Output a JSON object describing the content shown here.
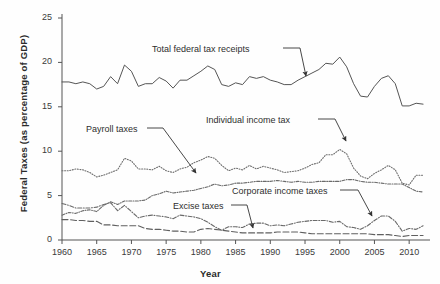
{
  "chart_data": {
    "type": "line",
    "title": "",
    "xlabel": "Year",
    "ylabel": "Federal Taxes (as percentage of GDP)",
    "xlim": [
      1960,
      2013
    ],
    "ylim": [
      0,
      25
    ],
    "ytick_values": [
      0,
      5,
      10,
      15,
      20,
      25
    ],
    "ytick_labels": [
      "0",
      "5",
      "10",
      "15",
      "20",
      "25"
    ],
    "xtick_values": [
      1960,
      1965,
      1970,
      1975,
      1980,
      1985,
      1990,
      1995,
      2000,
      2005,
      2010
    ],
    "xtick_labels": [
      "1960",
      "1965",
      "1970",
      "1975",
      "1980",
      "1985",
      "1990",
      "1995",
      "2000",
      "2005",
      "2010"
    ],
    "grid": false,
    "legend_position": "inline-annotations",
    "x": [
      1960,
      1961,
      1962,
      1963,
      1964,
      1965,
      1966,
      1967,
      1968,
      1969,
      1970,
      1971,
      1972,
      1973,
      1974,
      1975,
      1976,
      1977,
      1978,
      1979,
      1980,
      1981,
      1982,
      1983,
      1984,
      1985,
      1986,
      1987,
      1988,
      1989,
      1990,
      1991,
      1992,
      1993,
      1994,
      1995,
      1996,
      1997,
      1998,
      1999,
      2000,
      2001,
      2002,
      2003,
      2004,
      2005,
      2006,
      2007,
      2008,
      2009,
      2010,
      2011,
      2012
    ],
    "series": [
      {
        "name": "Total federal tax receipts",
        "style": "solid",
        "color": "#555555",
        "values": [
          17.8,
          17.8,
          17.6,
          17.8,
          17.6,
          17.0,
          17.3,
          18.4,
          17.6,
          19.7,
          19.0,
          17.3,
          17.6,
          17.6,
          18.3,
          17.9,
          17.1,
          18.0,
          18.0,
          18.5,
          19.0,
          19.6,
          19.2,
          17.5,
          17.3,
          17.7,
          17.5,
          18.4,
          18.2,
          18.4,
          18.0,
          17.8,
          17.5,
          17.5,
          18.0,
          18.4,
          18.8,
          19.2,
          19.9,
          19.8,
          20.6,
          19.5,
          17.6,
          16.2,
          16.1,
          17.3,
          18.2,
          18.5,
          17.6,
          15.1,
          15.1,
          15.4,
          15.3
        ]
      },
      {
        "name": "Individual income tax",
        "style": "dotted",
        "color": "#6e6e6e",
        "values": [
          7.8,
          7.8,
          8.0,
          7.9,
          7.6,
          7.1,
          7.3,
          7.6,
          7.9,
          9.2,
          8.9,
          8.0,
          8.0,
          7.9,
          8.3,
          7.8,
          7.6,
          8.0,
          8.2,
          8.7,
          9.0,
          9.4,
          9.2,
          8.4,
          7.8,
          8.1,
          7.9,
          8.4,
          8.0,
          8.3,
          8.1,
          7.9,
          7.6,
          7.7,
          7.8,
          8.1,
          8.5,
          8.7,
          9.6,
          9.6,
          10.2,
          9.7,
          8.1,
          7.2,
          6.9,
          7.5,
          7.9,
          8.4,
          7.9,
          6.4,
          6.2,
          7.3,
          7.3
        ]
      },
      {
        "name": "Payroll taxes",
        "style": "dashdot-fine",
        "color": "#6a6a6a",
        "values": [
          2.8,
          3.1,
          3.0,
          3.3,
          3.4,
          3.2,
          3.9,
          4.3,
          4.0,
          4.4,
          4.4,
          4.4,
          4.5,
          5.0,
          5.2,
          5.5,
          5.3,
          5.4,
          5.5,
          5.6,
          5.8,
          6.0,
          6.3,
          6.1,
          6.2,
          6.4,
          6.4,
          6.5,
          6.6,
          6.6,
          6.6,
          6.7,
          6.6,
          6.5,
          6.6,
          6.5,
          6.5,
          6.6,
          6.6,
          6.6,
          6.6,
          6.8,
          6.8,
          6.6,
          6.5,
          6.5,
          6.4,
          6.3,
          6.3,
          6.3,
          5.9,
          5.5,
          5.4
        ]
      },
      {
        "name": "Corporate income taxes",
        "style": "dashdot",
        "color": "#6a6a6a",
        "values": [
          4.1,
          3.9,
          3.6,
          3.6,
          3.6,
          3.7,
          4.0,
          4.2,
          3.3,
          3.9,
          3.2,
          2.5,
          2.7,
          2.8,
          2.7,
          2.6,
          2.4,
          2.8,
          2.7,
          2.6,
          2.4,
          2.0,
          1.5,
          1.1,
          1.5,
          1.5,
          1.4,
          1.8,
          1.9,
          1.9,
          1.6,
          1.7,
          1.6,
          1.8,
          2.0,
          2.1,
          2.2,
          2.2,
          2.2,
          2.0,
          2.1,
          1.5,
          1.4,
          1.2,
          1.6,
          2.2,
          2.7,
          2.7,
          2.1,
          1.0,
          1.3,
          1.2,
          1.6
        ]
      },
      {
        "name": "Excise taxes",
        "style": "longdash",
        "color": "#5f5f5f",
        "values": [
          2.3,
          2.3,
          2.2,
          2.2,
          2.1,
          2.1,
          1.7,
          1.7,
          1.6,
          1.6,
          1.6,
          1.6,
          1.3,
          1.2,
          1.2,
          1.1,
          1.0,
          1.0,
          0.9,
          0.9,
          1.2,
          1.3,
          1.2,
          1.1,
          1.0,
          0.9,
          0.8,
          0.8,
          0.8,
          0.8,
          0.8,
          0.9,
          0.9,
          0.9,
          0.9,
          0.8,
          0.7,
          0.7,
          0.7,
          0.7,
          0.7,
          0.7,
          0.7,
          0.7,
          0.7,
          0.6,
          0.6,
          0.6,
          0.5,
          0.4,
          0.5,
          0.5,
          0.5
        ]
      }
    ],
    "annotations": [
      {
        "name": "total-federal-tax-receipts",
        "text": "Total federal tax receipts",
        "label_x": 152,
        "label_y": 44,
        "leader": [
          [
            283,
            48
          ],
          [
            300,
            48
          ],
          [
            306,
            76
          ]
        ]
      },
      {
        "name": "individual-income-tax",
        "text": "Individual income tax",
        "label_x": 206,
        "label_y": 115,
        "leader": [
          [
            318,
            119
          ],
          [
            335,
            119
          ],
          [
            346,
            141
          ]
        ]
      },
      {
        "name": "payroll-taxes",
        "text": "Payroll taxes",
        "label_x": 86,
        "label_y": 124,
        "leader": [
          [
            147,
            128
          ],
          [
            163,
            128
          ],
          [
            196,
            173
          ]
        ]
      },
      {
        "name": "corporate-income-taxes",
        "text": "Corporate income taxes",
        "label_x": 232,
        "label_y": 186,
        "leader": [
          [
            340,
            190
          ],
          [
            358,
            190
          ],
          [
            372,
            216
          ]
        ]
      },
      {
        "name": "excise-taxes",
        "text": "Excise taxes",
        "label_x": 173,
        "label_y": 201,
        "leader": [
          [
            231,
            205
          ],
          [
            247,
            205
          ],
          [
            253,
            228
          ]
        ]
      }
    ]
  }
}
